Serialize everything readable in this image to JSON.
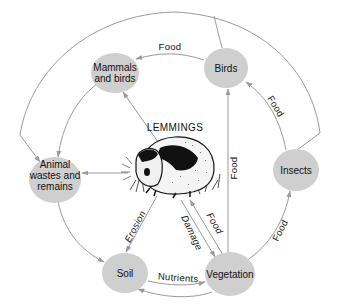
{
  "diagram": {
    "title": "LEMMINGS",
    "nodes": {
      "mammals_birds": {
        "line1": "Mammals",
        "line2": "and birds"
      },
      "birds": {
        "label": "Birds"
      },
      "animal_wastes": {
        "line1": "Animal",
        "line2": "wastes and",
        "line3": "remains"
      },
      "insects": {
        "label": "Insects"
      },
      "soil": {
        "label": "Soil"
      },
      "vegetation": {
        "label": "Vegetation"
      }
    },
    "edges": {
      "birds_to_mammals": "Food",
      "insects_to_birds": "Food",
      "vegetation_to_birds": "Food",
      "vegetation_to_insects": "Food",
      "vegetation_to_lemmings": "Food",
      "lemmings_to_vegetation": "Damage",
      "lemmings_to_soil": "Erosion",
      "soil_to_vegetation": "Nutrients"
    },
    "illustration": "lemming-drawing",
    "colors": {
      "node_fill": "#cfcfcf",
      "edge_stroke": "#9a9a9a",
      "text": "#111111"
    }
  }
}
